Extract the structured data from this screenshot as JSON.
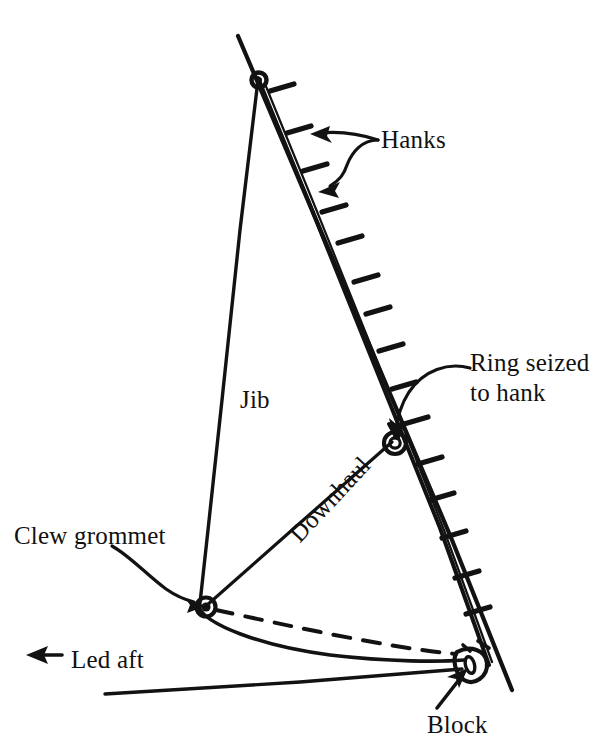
{
  "figure": {
    "kind": "technical-line-drawing",
    "background_color": "#ffffff",
    "ink_color": "#121212"
  },
  "labels": {
    "hanks": "Hanks",
    "ring_seized_to_hank_line1": "Ring seized",
    "ring_seized_to_hank_line2": "to hank",
    "jib": "Jib",
    "clew_grommet": "Clew grommet",
    "downhaul": "Downhaul",
    "led_aft": "Led aft",
    "block": "Block"
  },
  "diagram_data": {
    "type": "line-diagram",
    "units": "px",
    "canvas": [
      607,
      746
    ],
    "parts": [
      {
        "name": "forestay",
        "description": "Long straight stay running from upper left down to lower right, passing the block",
        "from": [
          238,
          36
        ],
        "to": [
          512,
          690
        ]
      },
      {
        "name": "jib-luff",
        "description": "Sail luff running parallel just inside the forestay",
        "from": [
          258,
          78
        ],
        "to": [
          489,
          665
        ]
      },
      {
        "name": "jib-leech",
        "description": "Leech from head down to clew grommet",
        "from": [
          258,
          78
        ],
        "to": [
          200,
          604
        ]
      },
      {
        "name": "jib-foot",
        "description": "Curved foot from clew grommet to block at the tack",
        "from": [
          200,
          604
        ],
        "to": [
          465,
          660
        ]
      },
      {
        "name": "downhaul-line",
        "description": "Line from clew grommet up to the ring seized to hank",
        "from": [
          205,
          606
        ],
        "to": [
          393,
          441
        ]
      },
      {
        "name": "downhaul-dashed-return",
        "description": "Dashed return leg of the downhaul from clew area to the block",
        "from": [
          215,
          609
        ],
        "to": [
          455,
          653
        ]
      },
      {
        "name": "sheet-led-aft",
        "description": "Line leaving the block toward the lower left, led aft",
        "from": [
          463,
          668
        ],
        "to": [
          105,
          694
        ]
      }
    ],
    "hank_count_on_luff": 13,
    "hardware": [
      {
        "name": "head-grommet",
        "shape": "small-ring",
        "at": [
          258,
          78
        ]
      },
      {
        "name": "ring-seized-to-hank",
        "shape": "double-ring",
        "at": [
          395,
          443
        ]
      },
      {
        "name": "clew-grommet",
        "shape": "filled-ring",
        "at": [
          206,
          607
        ]
      },
      {
        "name": "block",
        "shape": "teardrop-sheave",
        "at": [
          470,
          661
        ]
      }
    ],
    "leaders": [
      {
        "name": "hanks-leader",
        "style": "forked-double-arrow",
        "points_to": [
          "upper-hank",
          "lower-hank"
        ]
      },
      {
        "name": "ring-leader",
        "style": "curved-arrow",
        "points_to": "ring-seized-to-hank"
      },
      {
        "name": "clew-leader",
        "style": "curved-arrow",
        "points_to": "clew-grommet"
      },
      {
        "name": "block-leader",
        "style": "straight-arrow",
        "points_to": "block"
      },
      {
        "name": "led-aft-arrow",
        "style": "left-arrow",
        "direction": "aft"
      }
    ]
  }
}
